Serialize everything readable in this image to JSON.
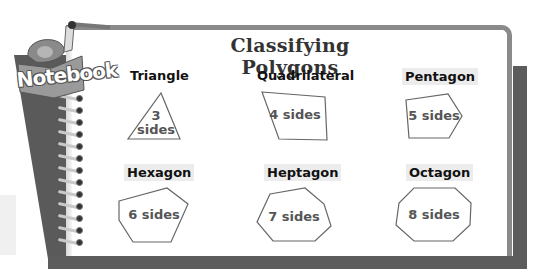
{
  "logo": {
    "text": "Notebook"
  },
  "title": "Classifying Polygons",
  "polygons": [
    {
      "name": "Triangle",
      "sides_label": "3 sides",
      "line1": "3",
      "line2": "sides"
    },
    {
      "name": "Quadrilateral",
      "sides_label": "4 sides"
    },
    {
      "name": "Pentagon",
      "sides_label": "5 sides"
    },
    {
      "name": "Hexagon",
      "sides_label": "6 sides"
    },
    {
      "name": "Heptagon",
      "sides_label": "7 sides"
    },
    {
      "name": "Octagon",
      "sides_label": "8 sides"
    }
  ],
  "colors": {
    "frame": "#5c5c5c",
    "page_border": "#8a8a8a",
    "label_highlight": "#ececec",
    "shape_stroke": "#666666",
    "shape_text": "#555555"
  }
}
